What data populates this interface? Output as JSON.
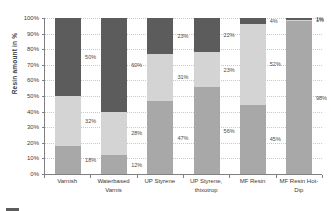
{
  "chart_data": {
    "type": "bar",
    "subtype": "stacked-100-percent",
    "title": "",
    "xlabel": "",
    "ylabel": "Resin amount in %",
    "ylim": [
      0,
      100
    ],
    "grid": true,
    "legend_position": "bottom-left",
    "categories": [
      "Varnish",
      "Waterbased Varnis",
      "UP Styrene",
      "UP Styrene, thixotrop",
      "MF Resin",
      "MF Resin Hot-Dip"
    ],
    "category_lines": [
      [
        "Varnish"
      ],
      [
        "Waterbased",
        "Varnis"
      ],
      [
        "UP Styrene"
      ],
      [
        "UP Styrene,",
        "thixotrop"
      ],
      [
        "MF Resin"
      ],
      [
        "MF Resin Hot-",
        "Dip"
      ]
    ],
    "ytick_labels": [
      "100%",
      "90%",
      "80%",
      "70%",
      "60%",
      "50%",
      "40%",
      "30%",
      "20%",
      "10%",
      "0%"
    ],
    "ytick_values": [
      100,
      90,
      80,
      70,
      60,
      50,
      40,
      30,
      20,
      10,
      0
    ],
    "series": [
      {
        "name": "series-top",
        "color": "#5c5c5c",
        "values": [
          50,
          60,
          23,
          22,
          4,
          1
        ],
        "labels": [
          "50%",
          "60%",
          "23%",
          "22%",
          "4%",
          "1%"
        ],
        "show_label": [
          true,
          true,
          true,
          true,
          true,
          true
        ]
      },
      {
        "name": "series-middle",
        "color": "#d4d4d4",
        "values": [
          32,
          28,
          31,
          23,
          52,
          1
        ],
        "labels": [
          "32%",
          "28%",
          "31%",
          "23%",
          "52%",
          "1%"
        ],
        "show_label": [
          true,
          true,
          true,
          true,
          true,
          true
        ]
      },
      {
        "name": "series-bottom",
        "color": "#a8a8a8",
        "values": [
          18,
          12,
          47,
          56,
          45,
          98
        ],
        "labels": [
          "18%",
          "12%",
          "47%",
          "56%",
          "45%",
          "98%"
        ],
        "show_label": [
          true,
          true,
          true,
          true,
          true,
          true
        ]
      }
    ],
    "legend": [
      {
        "label": "",
        "color": "#5c5c5c"
      }
    ]
  }
}
